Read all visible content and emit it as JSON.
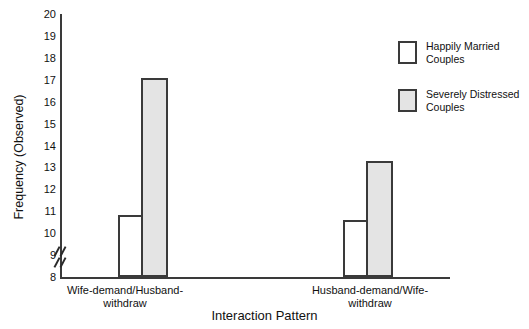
{
  "chart_data": {
    "type": "bar",
    "title": "",
    "xlabel": "Interaction Pattern",
    "ylabel": "Frequency (Observed)",
    "ylim": [
      8,
      20
    ],
    "yticks": [
      20,
      19,
      18,
      17,
      16,
      15,
      14,
      13,
      12,
      11,
      10,
      9,
      8
    ],
    "axis_break": true,
    "axis_break_note": "y-axis broken below 8",
    "grid": false,
    "legend_position": "top-right",
    "categories": [
      "Wife-demand/Husband-withdraw",
      "Husband-demand/Wife-withdraw"
    ],
    "series": [
      {
        "name": "Happily Married Couples",
        "color": "#ffffff",
        "values": [
          10.85,
          10.6
        ]
      },
      {
        "name": "Severely Distressed Couples",
        "color": "#e4e4e4",
        "values": [
          17.1,
          13.3
        ]
      }
    ]
  },
  "axis": {
    "y_title": "Frequency (Observed)",
    "x_title": "Interaction Pattern",
    "ticks": [
      "20",
      "19",
      "18",
      "17",
      "16",
      "15",
      "14",
      "13",
      "12",
      "11",
      "10",
      "9",
      "8"
    ]
  },
  "categories": [
    {
      "line1": "Wife-demand/Husband-",
      "line2": "withdraw"
    },
    {
      "line1": "Husband-demand/Wife-",
      "line2": "withdraw"
    }
  ],
  "legend": {
    "items": [
      {
        "line1": "Happily Married",
        "line2": "Couples",
        "swatch": "white-swatch"
      },
      {
        "line1": "Severely Distressed",
        "line2": "Couples",
        "swatch": "gray-swatch"
      }
    ]
  }
}
